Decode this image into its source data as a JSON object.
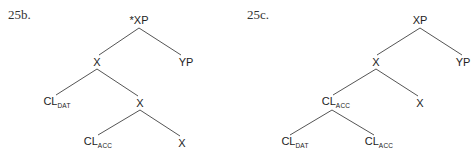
{
  "trees": [
    {
      "label": "25b.",
      "label_pos": [
        8,
        7
      ],
      "nodes": [
        {
          "id": "root",
          "text": "*XP",
          "sub": "",
          "x": 139,
          "y": 20
        },
        {
          "id": "x1",
          "text": "X",
          "sub": "",
          "x": 97,
          "y": 62
        },
        {
          "id": "yp",
          "text": "YP",
          "sub": "",
          "x": 186,
          "y": 62
        },
        {
          "id": "cl-dat",
          "text": "CL",
          "sub": "DAT",
          "x": 57,
          "y": 103
        },
        {
          "id": "x2",
          "text": "X",
          "sub": "",
          "x": 140,
          "y": 103
        },
        {
          "id": "cl-acc",
          "text": "CL",
          "sub": "ACC",
          "x": 98,
          "y": 143
        },
        {
          "id": "x3",
          "text": "X",
          "sub": "",
          "x": 182,
          "y": 143
        }
      ],
      "edges": [
        {
          "x1": 139,
          "y1": 28,
          "x2": 99,
          "y2": 55
        },
        {
          "x1": 139,
          "y1": 28,
          "x2": 181,
          "y2": 55
        },
        {
          "x1": 97,
          "y1": 69,
          "x2": 56,
          "y2": 95
        },
        {
          "x1": 97,
          "y1": 69,
          "x2": 138,
          "y2": 96
        },
        {
          "x1": 140,
          "y1": 110,
          "x2": 98,
          "y2": 135
        },
        {
          "x1": 140,
          "y1": 110,
          "x2": 180,
          "y2": 136
        }
      ]
    },
    {
      "label": "25c.",
      "label_pos": [
        247,
        7
      ],
      "nodes": [
        {
          "id": "root",
          "text": "XP",
          "sub": "",
          "x": 420,
          "y": 20
        },
        {
          "id": "x1",
          "text": "X",
          "sub": "",
          "x": 376,
          "y": 62
        },
        {
          "id": "yp",
          "text": "YP",
          "sub": "",
          "x": 463,
          "y": 62
        },
        {
          "id": "cl-acc-1",
          "text": "CL",
          "sub": "ACC",
          "x": 336,
          "y": 103
        },
        {
          "id": "x2",
          "text": "X",
          "sub": "",
          "x": 420,
          "y": 103
        },
        {
          "id": "cl-dat",
          "text": "CL",
          "sub": "DAT",
          "x": 295,
          "y": 143
        },
        {
          "id": "cl-acc-2",
          "text": "CL",
          "sub": "ACC",
          "x": 379,
          "y": 143
        }
      ],
      "edges": [
        {
          "x1": 420,
          "y1": 28,
          "x2": 377,
          "y2": 55
        },
        {
          "x1": 420,
          "y1": 28,
          "x2": 462,
          "y2": 55
        },
        {
          "x1": 376,
          "y1": 69,
          "x2": 333,
          "y2": 95
        },
        {
          "x1": 376,
          "y1": 69,
          "x2": 418,
          "y2": 96
        },
        {
          "x1": 332,
          "y1": 110,
          "x2": 290,
          "y2": 135
        },
        {
          "x1": 332,
          "y1": 110,
          "x2": 374,
          "y2": 135
        }
      ]
    }
  ]
}
